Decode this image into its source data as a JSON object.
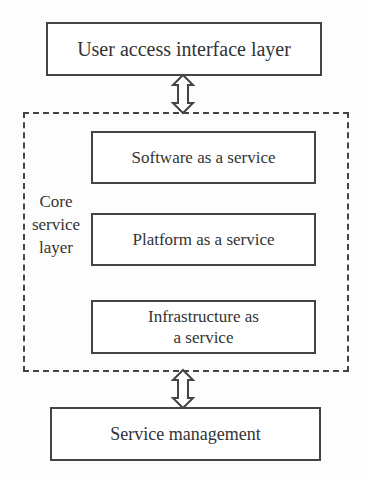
{
  "diagram": {
    "top_layer": "User access interface layer",
    "core_layer": {
      "label_lines": [
        "Core",
        "service",
        "layer"
      ],
      "services": [
        {
          "label": "Software as a service"
        },
        {
          "label": "Platform as a service"
        },
        {
          "label_lines": [
            "Infrastructure as",
            "a service"
          ]
        }
      ]
    },
    "bottom_layer": "Service management",
    "connectors": [
      {
        "from": "User access interface layer",
        "to": "Core service layer",
        "type": "bidirectional-arrow"
      },
      {
        "from": "Core service layer",
        "to": "Service management",
        "type": "bidirectional-arrow"
      }
    ]
  }
}
